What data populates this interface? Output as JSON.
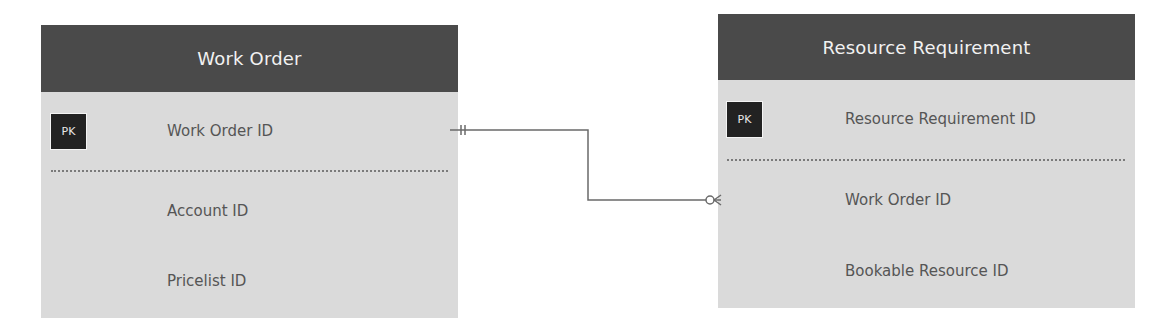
{
  "diagram": {
    "type": "entity-relationship",
    "entities": [
      {
        "name": "Work Order",
        "primary_key": {
          "badge": "PK",
          "field": "Work Order ID"
        },
        "fields": [
          "Account ID",
          "Pricelist ID"
        ]
      },
      {
        "name": "Resource Requirement",
        "primary_key": {
          "badge": "PK",
          "field": "Resource Requirement ID"
        },
        "fields": [
          "Work Order ID",
          "Bookable Resource ID"
        ]
      }
    ],
    "relationships": [
      {
        "from": "Work Order.Work Order ID",
        "to": "Resource Requirement.Work Order ID",
        "from_cardinality": "exactly-one",
        "to_cardinality": "zero-or-many"
      }
    ],
    "colors": {
      "header_bg": "#4a4a4a",
      "header_text": "#f2f2f2",
      "body_bg": "#dadada",
      "field_text": "#555555",
      "pk_badge_bg": "#222222",
      "connector": "#6a6a6a"
    }
  }
}
